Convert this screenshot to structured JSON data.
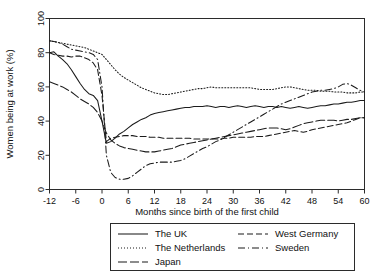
{
  "chart_data": {
    "type": "line",
    "title": "",
    "xlabel": "Months since birth of the first child",
    "ylabel": "Women being at work (%)",
    "xlim": [
      -12,
      60
    ],
    "ylim": [
      0,
      100
    ],
    "xticks": [
      -12,
      -6,
      0,
      6,
      12,
      18,
      24,
      30,
      36,
      42,
      48,
      54,
      60
    ],
    "yticks": [
      0,
      20,
      40,
      60,
      80,
      100
    ],
    "xtick_labels": [
      "-12",
      "-6",
      "0",
      "6",
      "12",
      "18",
      "24",
      "30",
      "36",
      "42",
      "48",
      "54",
      "60"
    ],
    "ytick_labels": [
      "0",
      "20",
      "40",
      "60",
      "80",
      "100"
    ],
    "grid": false,
    "legend_position": "below-axes",
    "x": [
      -12,
      -11,
      -10,
      -9,
      -8,
      -7,
      -6,
      -5,
      -4,
      -3,
      -2,
      -1,
      0,
      1,
      2,
      3,
      4,
      5,
      6,
      7,
      8,
      9,
      10,
      11,
      12,
      13,
      14,
      15,
      16,
      17,
      18,
      19,
      20,
      21,
      22,
      23,
      24,
      25,
      26,
      27,
      28,
      29,
      30,
      31,
      32,
      33,
      34,
      35,
      36,
      37,
      38,
      39,
      40,
      41,
      42,
      43,
      44,
      45,
      46,
      47,
      48,
      49,
      50,
      51,
      52,
      53,
      54,
      55,
      56,
      57,
      58,
      59,
      60
    ],
    "series": [
      {
        "name": "The UK",
        "style": "solid",
        "values": [
          80,
          80.5,
          78,
          76,
          73.5,
          70,
          66,
          62,
          58.5,
          56,
          55,
          52,
          40,
          27,
          28,
          30,
          32.5,
          34,
          36,
          38,
          39.5,
          41,
          42,
          43.5,
          44.5,
          45,
          45.5,
          46,
          46.5,
          47,
          47.5,
          48,
          48,
          48.5,
          48.5,
          48.5,
          49,
          48.5,
          48,
          48.5,
          48.5,
          48,
          48.5,
          49,
          48.5,
          48,
          48.5,
          49,
          48.5,
          48,
          48.5,
          48.5,
          48,
          48.5,
          48,
          47.5,
          48,
          48.5,
          48,
          47.5,
          48,
          48.5,
          49,
          49,
          49.5,
          50,
          50,
          50.5,
          51,
          51,
          51.5,
          52,
          52
        ]
      },
      {
        "name": "The Netherlands",
        "style": "dotted",
        "values": [
          87,
          86.5,
          86,
          85.5,
          85,
          84.5,
          84,
          83.5,
          83,
          82,
          81,
          80,
          79,
          76,
          73,
          70,
          67.5,
          65.5,
          64,
          62.5,
          61,
          59.5,
          58.5,
          57.5,
          56.5,
          56,
          55.5,
          55.5,
          56,
          56.5,
          57,
          57.5,
          58,
          58.5,
          59,
          59,
          59.5,
          60,
          59.5,
          59.5,
          59.5,
          59.5,
          59.5,
          59.5,
          59.5,
          59.5,
          59.5,
          59,
          58.5,
          58.5,
          58.5,
          58.5,
          59,
          59.5,
          60,
          60,
          59.5,
          59,
          58.5,
          58,
          58,
          58,
          57.5,
          57.5,
          57.5,
          57,
          57,
          57,
          56.5,
          56.5,
          56.5,
          57,
          57
        ]
      },
      {
        "name": "Japan",
        "style": "dashdot",
        "values": [
          63,
          62,
          61,
          60,
          58.5,
          57,
          55,
          53,
          51.5,
          50,
          48,
          45,
          40,
          33,
          29,
          27,
          25.5,
          24.5,
          24,
          23.5,
          23,
          22.5,
          22,
          22,
          22,
          22.5,
          23,
          23.5,
          24,
          25,
          26,
          26.5,
          27,
          27.5,
          28,
          28.5,
          29,
          29.5,
          30,
          30.5,
          31,
          31.5,
          32,
          32.5,
          33,
          33.5,
          34,
          34.5,
          35,
          35.5,
          36,
          36,
          36,
          35.5,
          35,
          35.5,
          36.5,
          37.5,
          38.5,
          39,
          39.5,
          40,
          40.5,
          40.5,
          40.5,
          40.5,
          40,
          40.5,
          41,
          41,
          41.5,
          42,
          42
        ]
      },
      {
        "name": "West Germany",
        "style": "dashed",
        "values": [
          80,
          79,
          78.5,
          78,
          78,
          77.5,
          78,
          78,
          77,
          76,
          74,
          70,
          55,
          28,
          30,
          30.5,
          31,
          31.5,
          31.5,
          31.5,
          31,
          31,
          31,
          30.5,
          30.5,
          30.5,
          30,
          30,
          30,
          30,
          30,
          30,
          30,
          29.5,
          29.5,
          29.5,
          29.5,
          29.5,
          29.5,
          29.5,
          30,
          30,
          30.5,
          30.5,
          30.5,
          30.5,
          30.5,
          31,
          31,
          31,
          31.5,
          32,
          32.5,
          33,
          33.5,
          34,
          34.5,
          34,
          33.5,
          34,
          35,
          35.5,
          36,
          36.5,
          37,
          37.5,
          38,
          38.5,
          39,
          40,
          41,
          42,
          42
        ]
      },
      {
        "name": "Sweden",
        "style": "dashdotdot",
        "values": [
          87,
          86.5,
          86,
          85,
          83.5,
          82,
          81.5,
          81,
          80.5,
          80,
          79,
          76,
          60,
          20,
          10,
          7,
          6,
          6,
          6.5,
          8,
          10,
          12,
          14,
          15,
          15.5,
          16,
          16,
          16,
          16,
          16.5,
          17,
          18,
          19.5,
          21,
          22.5,
          24,
          25,
          26.5,
          28,
          29,
          30.5,
          32,
          33.5,
          35,
          36.5,
          38,
          39.5,
          41,
          42.5,
          44,
          45.5,
          47,
          48.5,
          50,
          51,
          52,
          53,
          54,
          55,
          56,
          57,
          57.5,
          58,
          58,
          58.5,
          59,
          60,
          61.5,
          62,
          61,
          59.5,
          58,
          57
        ]
      }
    ]
  },
  "legend": {
    "entries": [
      {
        "label": "The UK",
        "style": "solid"
      },
      {
        "label": "The Netherlands",
        "style": "dotted"
      },
      {
        "label": "Japan",
        "style": "dashdot"
      },
      {
        "label": "West Germany",
        "style": "dashed"
      },
      {
        "label": "Sweden",
        "style": "dashdotdot"
      }
    ]
  },
  "colors": {
    "line": "#1b1b1b",
    "frame": "#2b2b2b",
    "background": "#ffffff"
  }
}
